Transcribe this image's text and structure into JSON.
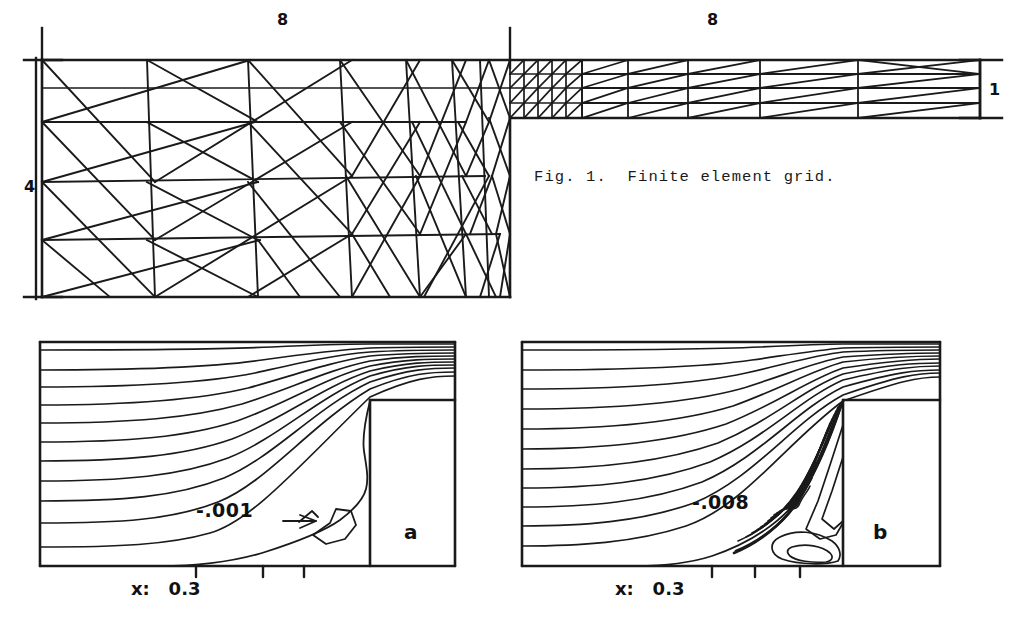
{
  "figure": {
    "caption": "Fig. 1.  Finite element grid.",
    "caption_position": {
      "x": 534,
      "y": 168
    }
  },
  "grid_panel": {
    "name": "finite-element-grid",
    "dimension_labels": [
      {
        "id": "top-left-width",
        "text": "8",
        "x": 277,
        "y": 10
      },
      {
        "id": "top-right-width",
        "text": "8",
        "x": 707,
        "y": 10
      },
      {
        "id": "left-height",
        "text": "4",
        "x": 24,
        "y": 177
      },
      {
        "id": "right-height",
        "text": "1",
        "x": 989,
        "y": 80
      }
    ],
    "geometry": {
      "upstream_left": 42,
      "upstream_right": 510,
      "upstream_top": 60,
      "upstream_bottom": 297,
      "channel_right": 980,
      "channel_top": 60,
      "channel_bottom": 118
    }
  },
  "contour_panels": [
    {
      "id": "panel-a",
      "letter": "a",
      "letter_pos": {
        "x": 404,
        "y": 520
      },
      "contour_label": "-.001",
      "contour_label_pos": {
        "x": 196,
        "y": 499
      },
      "axis_prefix": "x:",
      "axis_value": "0.3",
      "axis_text": "x:   0.3",
      "axis_text_pos": {
        "x": 131,
        "y": 578
      },
      "box": {
        "left": 40,
        "top": 342,
        "right": 455,
        "bottom": 566
      },
      "step": {
        "x": 370,
        "y": 400
      },
      "streamline_count": 11,
      "tick_positions": [
        196,
        263,
        304
      ],
      "recirculation_style": "sparse-single-bubble"
    },
    {
      "id": "panel-b",
      "letter": "b",
      "letter_pos": {
        "x": 873,
        "y": 520
      },
      "contour_label": "-.008",
      "contour_label_pos": {
        "x": 692,
        "y": 491
      },
      "axis_prefix": "x:",
      "axis_value": "0.3",
      "axis_text": "x:   0.3",
      "axis_text_pos": {
        "x": 615,
        "y": 578
      },
      "box": {
        "left": 522,
        "top": 342,
        "right": 940,
        "bottom": 566
      },
      "step": {
        "x": 843,
        "y": 400
      },
      "streamline_count": 11,
      "tick_positions": [
        712,
        755,
        800
      ],
      "recirculation_style": "dense-multi-contour"
    }
  ],
  "colors": {
    "ink": "#1a1a1a",
    "paper": "#ffffff"
  }
}
